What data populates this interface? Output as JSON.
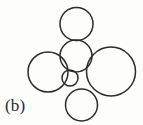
{
  "figure": {
    "label": "(b)",
    "caption_position": "bottom-left",
    "background_color": "#fdfdfb",
    "stroke_color": "#2b2b2b",
    "stroke_width": 1.5,
    "fill": "none",
    "width": 143,
    "height": 125
  },
  "chart_data": {
    "type": "scatter",
    "title": "(b)",
    "xlabel": "",
    "ylabel": "",
    "xlim": [
      0,
      143
    ],
    "ylim": [
      0,
      125
    ],
    "grid": false,
    "legend": "none",
    "series": [
      {
        "name": "circles",
        "marker": "open-circle",
        "points": [
          {
            "id": "circle-top",
            "cx": 76.5,
            "cy": 24.0,
            "r": 16.5
          },
          {
            "id": "circle-middle",
            "cx": 76.0,
            "cy": 56.0,
            "r": 16.0
          },
          {
            "id": "circle-left",
            "cx": 48.0,
            "cy": 72.0,
            "r": 20.0
          },
          {
            "id": "circle-right",
            "cx": 111.0,
            "cy": 71.5,
            "r": 24.5
          },
          {
            "id": "circle-center",
            "cx": 70.0,
            "cy": 78.0,
            "r": 8.0
          },
          {
            "id": "circle-bottom",
            "cx": 81.5,
            "cy": 105.0,
            "r": 16.0
          }
        ]
      }
    ],
    "labels": [
      {
        "id": "panel-label",
        "text": "(b)",
        "x": 5,
        "y": 108
      }
    ]
  }
}
